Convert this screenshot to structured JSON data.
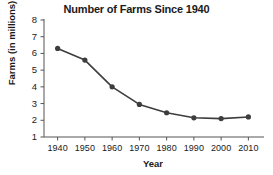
{
  "chart_data": {
    "type": "line",
    "title": "Number of Farms Since 1940",
    "xlabel": "Year",
    "ylabel": "Farms (in millions)",
    "x": [
      1940,
      1950,
      1960,
      1970,
      1980,
      1990,
      2000,
      2010
    ],
    "values": [
      6.3,
      5.6,
      4.0,
      2.95,
      2.45,
      2.15,
      2.1,
      2.2
    ],
    "xtick_labels": [
      "1940",
      "1950",
      "1960",
      "1970",
      "1980",
      "1990",
      "2000",
      "2010"
    ],
    "ytick_labels": [
      "8",
      "7",
      "6",
      "5",
      "4",
      "3",
      "2",
      "1"
    ],
    "yticks": [
      8,
      7,
      6,
      5,
      4,
      3,
      2,
      1
    ],
    "ylim": [
      1,
      8
    ],
    "xlim": [
      1935,
      2015
    ],
    "grid": false,
    "legend": false,
    "marker": "circle",
    "line_color": "#3d3d3d",
    "marker_color": "#3d3d3d",
    "axis_color": "#555555",
    "background": "#ffffff"
  }
}
